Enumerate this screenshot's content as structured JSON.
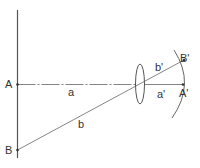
{
  "diagram": {
    "type": "optics-lens-imaging",
    "colors": {
      "line": "#555555",
      "axis": "#666666",
      "text": "#333333",
      "background": "#ffffff"
    },
    "labels": {
      "A": "A",
      "B": "B",
      "a": "a",
      "b": "b",
      "b_prime": "b'",
      "a_prime": "a'",
      "B_prime": "B'",
      "A_prime": "A'"
    }
  }
}
